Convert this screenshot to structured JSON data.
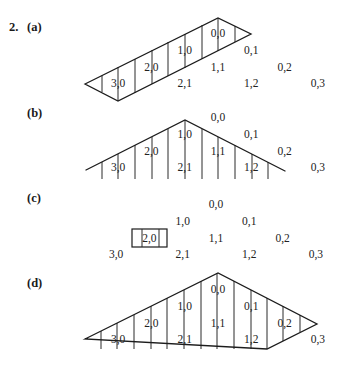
{
  "problem": {
    "number": "2.",
    "parts": [
      {
        "id": "a",
        "label": "(a)",
        "label_pos": [
          27,
          31
        ],
        "grid_origin": [
          218,
          37
        ],
        "cells": [
          {
            "text": "0,0",
            "i": 0,
            "j": 0
          },
          {
            "text": "1,0",
            "i": 1,
            "j": 0
          },
          {
            "text": "0,1",
            "i": 0,
            "j": 1
          },
          {
            "text": "2,0",
            "i": 2,
            "j": 0
          },
          {
            "text": "1,1",
            "i": 1,
            "j": 1
          },
          {
            "text": "0,2",
            "i": 0,
            "j": 2
          },
          {
            "text": "3,0",
            "i": 3,
            "j": 0
          },
          {
            "text": "2,1",
            "i": 2,
            "j": 1
          },
          {
            "text": "1,2",
            "i": 1,
            "j": 2
          },
          {
            "text": "0,3",
            "i": 0,
            "j": 3
          }
        ],
        "shaded_region": "band from 3,0 to 0,0 (first column i,0)",
        "outline": [
          [
            85,
            84
          ],
          [
            218,
            18
          ],
          [
            251,
            34
          ],
          [
            118,
            101
          ]
        ],
        "vlines": [
          [
            102,
            75.5,
            92
          ],
          [
            118,
            67,
            101
          ],
          [
            135,
            59,
            93
          ],
          [
            152,
            50,
            84
          ],
          [
            168,
            42,
            76
          ],
          [
            185,
            34,
            68
          ],
          [
            202,
            25,
            59
          ],
          [
            218,
            18,
            51
          ],
          [
            235,
            26,
            42
          ]
        ]
      },
      {
        "id": "b",
        "label": "(b)",
        "label_pos": [
          27,
          117
        ],
        "grid_origin": [
          218,
          121
        ],
        "cells": [
          {
            "text": "0,0",
            "i": 0,
            "j": 0
          },
          {
            "text": "1,0",
            "i": 1,
            "j": 0
          },
          {
            "text": "0,1",
            "i": 0,
            "j": 1
          },
          {
            "text": "2,0",
            "i": 2,
            "j": 0
          },
          {
            "text": "1,1",
            "i": 1,
            "j": 1
          },
          {
            "text": "0,2",
            "i": 0,
            "j": 2
          },
          {
            "text": "3,0",
            "i": 3,
            "j": 0
          },
          {
            "text": "2,1",
            "i": 2,
            "j": 1
          },
          {
            "text": "1,2",
            "i": 1,
            "j": 2
          },
          {
            "text": "0,3",
            "i": 0,
            "j": 3
          }
        ],
        "shaded_region": "triangle under peak covering 3,0 2,0 1,0 1,1 2,1 1,2",
        "outline": [
          [
            86,
            170
          ],
          [
            185,
            120
          ],
          [
            285,
            171
          ]
        ],
        "vlines": [
          [
            102,
            162,
            179
          ],
          [
            118,
            154,
            179
          ],
          [
            135,
            145,
            179
          ],
          [
            152,
            137,
            179
          ],
          [
            168,
            129,
            179
          ],
          [
            185,
            120,
            179
          ],
          [
            202,
            129,
            179
          ],
          [
            218,
            137,
            179
          ],
          [
            235,
            145,
            179
          ],
          [
            252,
            154,
            179
          ],
          [
            268,
            162,
            179
          ]
        ]
      },
      {
        "id": "c",
        "label": "(c)",
        "label_pos": [
          27,
          202
        ],
        "grid_origin": [
          216,
          208
        ],
        "cells": [
          {
            "text": "0,0",
            "i": 0,
            "j": 0
          },
          {
            "text": "1,0",
            "i": 1,
            "j": 0
          },
          {
            "text": "0,1",
            "i": 0,
            "j": 1
          },
          {
            "text": "2,0",
            "i": 2,
            "j": 0,
            "boxed": true
          },
          {
            "text": "1,1",
            "i": 1,
            "j": 1
          },
          {
            "text": "0,2",
            "i": 0,
            "j": 2
          },
          {
            "text": "3,0",
            "i": 3,
            "j": 0
          },
          {
            "text": "2,1",
            "i": 2,
            "j": 1
          },
          {
            "text": "1,2",
            "i": 1,
            "j": 2
          },
          {
            "text": "0,3",
            "i": 0,
            "j": 3
          }
        ],
        "box": {
          "x": 132,
          "y": 229,
          "w": 35,
          "h": 18,
          "inner_lines": [
            142,
            159
          ]
        }
      },
      {
        "id": "d",
        "label": "(d)",
        "label_pos": [
          27,
          287
        ],
        "grid_origin": [
          218,
          293
        ],
        "cells": [
          {
            "text": "0,0",
            "i": 0,
            "j": 0
          },
          {
            "text": "1,0",
            "i": 1,
            "j": 0
          },
          {
            "text": "0,1",
            "i": 0,
            "j": 1
          },
          {
            "text": "2,0",
            "i": 2,
            "j": 0
          },
          {
            "text": "1,1",
            "i": 1,
            "j": 1
          },
          {
            "text": "0,2",
            "i": 0,
            "j": 2
          },
          {
            "text": "3,0",
            "i": 3,
            "j": 0
          },
          {
            "text": "2,1",
            "i": 2,
            "j": 1
          },
          {
            "text": "1,2",
            "i": 1,
            "j": 2
          },
          {
            "text": "0,3",
            "i": 0,
            "j": 3
          }
        ],
        "shaded_region": "all cells except 0,3",
        "outline": [
          [
            85,
            339
          ],
          [
            218,
            273
          ],
          [
            317,
            324
          ],
          [
            267,
            349
          ]
        ],
        "vlines": [
          [
            101,
            331,
            349
          ],
          [
            117,
            323,
            349
          ],
          [
            134,
            315,
            349
          ],
          [
            151,
            306,
            349
          ],
          [
            167,
            298,
            349
          ],
          [
            184,
            290,
            349
          ],
          [
            201,
            281,
            349
          ],
          [
            217,
            273,
            349
          ],
          [
            234,
            281,
            349
          ],
          [
            251,
            290,
            349
          ],
          [
            267,
            298,
            349
          ],
          [
            283,
            306,
            341
          ],
          [
            300,
            315,
            332
          ]
        ]
      }
    ],
    "grid_step": {
      "dx": 33.3,
      "dy": 16.8
    }
  }
}
